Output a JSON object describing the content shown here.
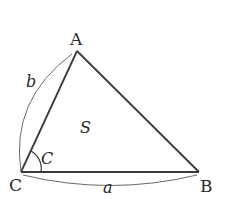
{
  "diagram": {
    "type": "triangle",
    "vertices": {
      "A": {
        "label": "A",
        "x": 77,
        "y": 51
      },
      "B": {
        "label": "B",
        "x": 199,
        "y": 172
      },
      "C": {
        "label": "C",
        "x": 21,
        "y": 172
      }
    },
    "sides": {
      "a": {
        "label": "a",
        "from": "C",
        "to": "B"
      },
      "b": {
        "label": "b",
        "from": "C",
        "to": "A"
      }
    },
    "angle": {
      "label": "C",
      "vertex": "C"
    },
    "area": {
      "label": "S"
    },
    "colors": {
      "line": "#3a3a3a",
      "brace": "#6a6a6a",
      "text": "#2a2a2a"
    }
  }
}
